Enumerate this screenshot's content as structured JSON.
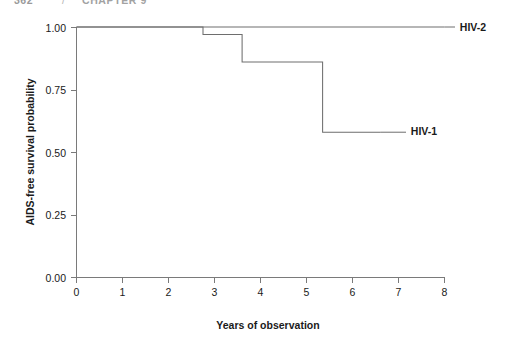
{
  "page": {
    "running_header_number": "362",
    "running_header_separator": "/",
    "running_header_title": "CHAPTER 9"
  },
  "chart_data": {
    "type": "line",
    "title": "",
    "subtitle": "",
    "xlabel": "Years of observation",
    "ylabel": "AIDS-free survival probability",
    "xlim": [
      0,
      8
    ],
    "ylim": [
      0,
      1
    ],
    "xticks": [
      0,
      1,
      2,
      3,
      4,
      5,
      6,
      7,
      8
    ],
    "xticklabels": [
      "0",
      "1",
      "2",
      "3",
      "4",
      "5",
      "6",
      "7",
      "8"
    ],
    "yticks": [
      0,
      0.25,
      0.5,
      0.75,
      1
    ],
    "yticklabels": [
      "0.00",
      "0.25",
      "0.50",
      "0.75",
      "1.00"
    ],
    "grid": false,
    "legend_position": "inline-annotations",
    "step_style": "post",
    "series": [
      {
        "name": "HIV-2",
        "label": "HIV-2",
        "color": "#6e6e6e",
        "label_x": 7.55,
        "label_y": 1.0,
        "x": [
          0,
          8
        ],
        "y": [
          1.0,
          1.0
        ],
        "steps": [
          {
            "x": 0.0,
            "y": 1.0
          },
          {
            "x": 8.0,
            "y": 1.0
          }
        ]
      },
      {
        "name": "HIV-1",
        "label": "HIV-1",
        "color": "#6e6e6e",
        "label_x": 6.2,
        "label_y": 0.58,
        "x": [
          0,
          2.75,
          2.75,
          3.6,
          3.6,
          5.35,
          5.35,
          6.6
        ],
        "y": [
          1.0,
          1.0,
          0.97,
          0.97,
          0.86,
          0.86,
          0.58,
          0.58
        ],
        "steps": [
          {
            "x": 0.0,
            "y": 1.0
          },
          {
            "x": 2.75,
            "y": 0.97
          },
          {
            "x": 3.6,
            "y": 0.86
          },
          {
            "x": 5.35,
            "y": 0.58
          },
          {
            "x": 6.6,
            "y": 0.58
          }
        ]
      }
    ],
    "annotations": [
      {
        "text": "HIV-2",
        "x": 7.55,
        "y": 1.0,
        "leader": true
      },
      {
        "text": "HIV-1",
        "x": 6.2,
        "y": 0.58,
        "leader": true
      }
    ]
  }
}
